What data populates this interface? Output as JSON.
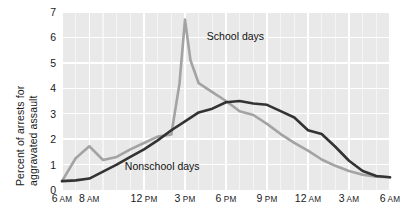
{
  "chart_data": {
    "type": "line",
    "title": "",
    "xlabel": "",
    "ylabel_line1": "Percent of arrests for",
    "ylabel_line2": "aggravated assault",
    "ylim": [
      0,
      7
    ],
    "yticks": [
      0,
      1,
      2,
      3,
      4,
      5,
      6,
      7
    ],
    "ytick_labels": [
      "0",
      "1",
      "2",
      "3",
      "4",
      "5",
      "6",
      "7"
    ],
    "xlim_hours": [
      6,
      30
    ],
    "xtick_hours": [
      6,
      8,
      12,
      15,
      18,
      21,
      24,
      27,
      30
    ],
    "xtick_labels": [
      {
        "num": "6",
        "period": "AM"
      },
      {
        "num": "8",
        "period": "AM"
      },
      {
        "num": "12",
        "period": "PM"
      },
      {
        "num": "3",
        "period": "PM"
      },
      {
        "num": "6",
        "period": "PM"
      },
      {
        "num": "9",
        "period": "PM"
      },
      {
        "num": "12",
        "period": "AM"
      },
      {
        "num": "3",
        "period": "AM"
      },
      {
        "num": "6",
        "period": "AM"
      }
    ],
    "grid": true,
    "legend_position": "inline-annotation",
    "plot_background": "#e9e9e9",
    "grid_color": "#ffffff",
    "series": [
      {
        "name": "School days",
        "color": "#a3a3a3",
        "label_x_hour": 16.6,
        "label_y_value": 6.0,
        "x": [
          6,
          7,
          8,
          9,
          10,
          11,
          12,
          13,
          14,
          14.6,
          15,
          15.4,
          16,
          17,
          18,
          19,
          20,
          21,
          22,
          23,
          24,
          25,
          26,
          27,
          28,
          29,
          30
        ],
        "values": [
          0.35,
          1.25,
          1.72,
          1.18,
          1.3,
          1.6,
          1.85,
          2.1,
          2.18,
          4.2,
          6.7,
          5.1,
          4.2,
          3.85,
          3.5,
          3.1,
          2.95,
          2.6,
          2.2,
          1.85,
          1.55,
          1.2,
          0.95,
          0.75,
          0.6,
          0.52,
          0.5
        ]
      },
      {
        "name": "Nonschool days",
        "color": "#333333",
        "label_x_hour": 10.6,
        "label_y_value": 0.92,
        "x": [
          6,
          7,
          8,
          9,
          10,
          11,
          12,
          13,
          14,
          15,
          16,
          17,
          18,
          19,
          20,
          21,
          22,
          23,
          24,
          25,
          26,
          27,
          28,
          29,
          30
        ],
        "values": [
          0.35,
          0.38,
          0.45,
          0.72,
          1.0,
          1.3,
          1.6,
          1.95,
          2.35,
          2.7,
          3.05,
          3.2,
          3.45,
          3.5,
          3.4,
          3.35,
          3.1,
          2.85,
          2.35,
          2.2,
          1.7,
          1.15,
          0.75,
          0.55,
          0.5
        ]
      }
    ]
  }
}
